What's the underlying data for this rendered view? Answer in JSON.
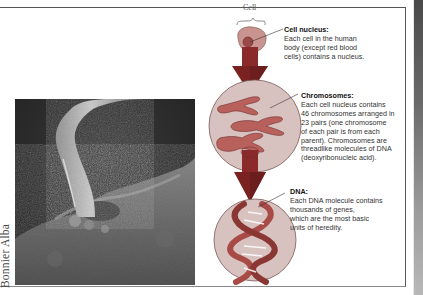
{
  "figure": {
    "photo_credit": "Bonnier Alba",
    "photo_description": "Scanning electron micrograph of a stalk-like structure emerging from a cell surface"
  },
  "diagram": {
    "cell_label": "Cell",
    "stages": [
      {
        "id": "cell-nucleus",
        "heading": "Cell nucleus:",
        "lines": [
          "Each cell in the human",
          "body (except red blood",
          "cells) contains a nucleus."
        ]
      },
      {
        "id": "chromosomes",
        "heading": "Chromosomes:",
        "lines": [
          "Each cell nucleus contains",
          "46 chromosomes arranged in",
          "23 pairs (one chromosome",
          "of each pair is from each",
          "parent). Chromosomes are",
          "threadlike molecules of DNA",
          "(deoxyribonucleic acid)."
        ]
      },
      {
        "id": "dna",
        "heading": "DNA:",
        "lines": [
          "Each DNA molecule contains",
          "thousands of genes,",
          "which are the most basic",
          "units of heredity."
        ]
      }
    ]
  },
  "colors": {
    "arrow": "#8a2a2a",
    "arrow_dark": "#5e1a1a",
    "circle_fill": "#d8c2c0",
    "circle_stroke": "#7a5a58",
    "chromosome": "#b8605c",
    "chromosome_stroke": "#6e2f2c",
    "dna_strand": "#a84a46",
    "frame": "#555555"
  }
}
